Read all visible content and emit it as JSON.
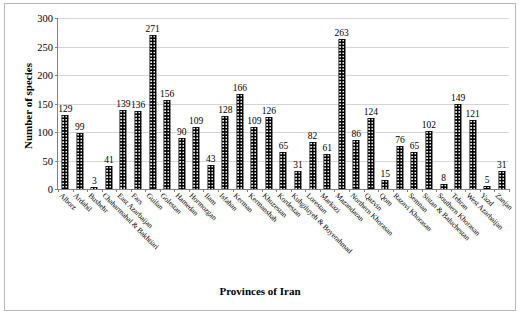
{
  "chart_data": {
    "type": "bar",
    "title": "",
    "xlabel": "Provinces of Iran",
    "ylabel": "Number of species",
    "ylim": [
      0,
      300
    ],
    "yticks": [
      0,
      50,
      100,
      150,
      200,
      250,
      300
    ],
    "grid": true,
    "legend": "none",
    "bar_color": "#000000",
    "categories": [
      "Alborz",
      "Ardabil",
      "Bushehr",
      "Chaharmahal & Bakhtiari",
      "East Azarbaijan",
      "Fars",
      "Guilan",
      "Golestan",
      "Hamedan",
      "Hormozgan",
      "Ilam",
      "Isfahan",
      "Kerman",
      "Kermanshah",
      "Khuzestan",
      "Kordestan",
      "Kuhgiluyeh & Boyerahmad",
      "Lorestan",
      "Markazi",
      "Mazandaran",
      "Northern Khorasan",
      "Qazvin",
      "Qom",
      "Razavi Khorasan",
      "Semnan",
      "Sistan & Baluchestan",
      "Southern Khorasan",
      "Tehran",
      "West Azarbaijan",
      "Yazd",
      "Zanjan"
    ],
    "values": [
      129,
      99,
      3,
      41,
      139,
      136,
      271,
      156,
      90,
      109,
      43,
      128,
      166,
      109,
      126,
      65,
      31,
      82,
      61,
      263,
      86,
      124,
      15,
      76,
      65,
      102,
      8,
      149,
      121,
      5,
      31
    ]
  }
}
